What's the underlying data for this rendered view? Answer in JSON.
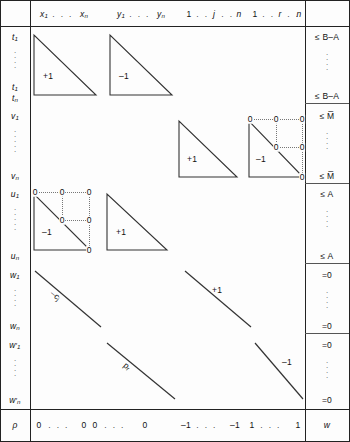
{
  "figure": {
    "type": "block-matrix-tableau"
  },
  "columns": {
    "row_label_header": "",
    "groups": [
      {
        "name": "x-block",
        "first": "x",
        "first_sub": "1",
        "last": "x",
        "last_sub": "n",
        "dots": "· · ·"
      },
      {
        "name": "y-block",
        "first": "y",
        "first_sub": "1",
        "last": "y",
        "last_sub": "n",
        "dots": "· · ·"
      },
      {
        "name": "j-block",
        "first": "1",
        "mid": "j",
        "last": "n",
        "dots": "· ·"
      },
      {
        "name": "r-block",
        "first": "1",
        "mid": "r",
        "last": "n",
        "dots": "· ·"
      }
    ],
    "rhs_header": ""
  },
  "row_labels": [
    {
      "base": "t",
      "sub": "1"
    },
    {
      "base": "t",
      "sub": "1"
    },
    {
      "base": "t",
      "sub": "n"
    },
    {
      "base": "v",
      "sub": "1"
    },
    {
      "base": "v",
      "sub": "n"
    },
    {
      "base": "u",
      "sub": "1"
    },
    {
      "base": "u",
      "sub": "n"
    },
    {
      "base": "w",
      "sub": "1"
    },
    {
      "base": "w",
      "sub": "n"
    },
    {
      "base": "w",
      "sub": "1",
      "prime": true
    },
    {
      "base": "w",
      "sub": "n",
      "prime": true
    },
    {
      "base": "ρ",
      "sub": ""
    }
  ],
  "rhs_labels": [
    "≤ B–A",
    "≤ B–A",
    "≤ M̅",
    "≤ M̅",
    "≤ A",
    "≤ A",
    "=0",
    "=0",
    "=0",
    "=0",
    "w"
  ],
  "blocks": [
    {
      "band": "t-rows",
      "col": "x-block",
      "shape": "triangle",
      "value": "+1"
    },
    {
      "band": "t-rows",
      "col": "y-block",
      "shape": "triangle",
      "value": "–1"
    },
    {
      "band": "v-rows",
      "col": "j-block",
      "shape": "triangle",
      "value": "+1"
    },
    {
      "band": "v-rows",
      "col": "r-block",
      "shape": "triangle",
      "value": "–1",
      "zeros": true
    },
    {
      "band": "u-rows",
      "col": "x-block",
      "shape": "triangle",
      "value": "–1",
      "zeros": true
    },
    {
      "band": "u-rows",
      "col": "y-block",
      "shape": "triangle",
      "value": "+1"
    },
    {
      "band": "w-rows",
      "col": "x-block",
      "shape": "diagonal",
      "value": "–c",
      "value_sub": "j"
    },
    {
      "band": "w-rows",
      "col": "j-block",
      "shape": "diagonal",
      "value": "+1"
    },
    {
      "band": "w2-rows",
      "col": "y-block",
      "shape": "diagonal",
      "value": "p",
      "value_sub": "r"
    },
    {
      "band": "w2-rows",
      "col": "r-block",
      "shape": "diagonal",
      "value": "–1"
    }
  ],
  "zero_marks": {
    "glyph": "0"
  },
  "bottom_row": {
    "label": "ρ",
    "x_block": {
      "first": "0",
      "last": "0",
      "dots": "· · ·"
    },
    "y_block": {
      "first": "0",
      "last": "0",
      "dots": "· · ·"
    },
    "j_block": {
      "first": "–1",
      "last": "–1",
      "dots": "· · ·"
    },
    "r_block": {
      "first": "1",
      "last": "1",
      "dots": "· · ·"
    },
    "rhs": "w"
  },
  "colors": {
    "ink": "#111111",
    "rule": "#222222",
    "light_rule": "#555555",
    "dotted": "#777777",
    "paper": "#fdfdfd"
  }
}
